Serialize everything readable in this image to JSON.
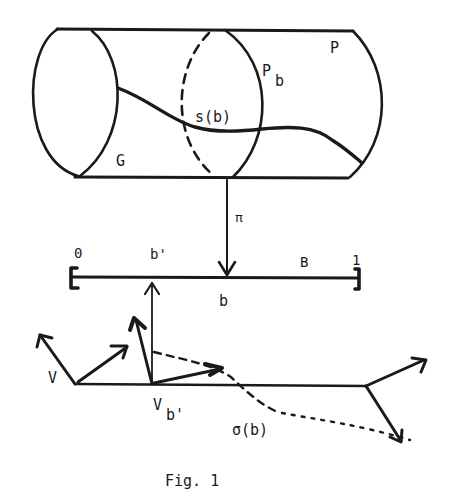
{
  "figure": {
    "caption": "Fig. 1",
    "ink_color": "#1a1a1a",
    "background": "#ffffff"
  },
  "bundle": {
    "total_space_label": "P",
    "fiber_label_main": "P",
    "fiber_label_sub": "b",
    "section_label": "s(b)",
    "group_label": "G"
  },
  "projection": {
    "label": "π"
  },
  "base": {
    "label": "B",
    "start_label": "0",
    "end_label": "1",
    "point_b_label": "b",
    "point_b_prime_label": "b'"
  },
  "frame_bundle": {
    "vector_space_label": "V",
    "fiber_label_main": "V",
    "fiber_label_sub": "b'",
    "section_label": "σ(b)"
  }
}
